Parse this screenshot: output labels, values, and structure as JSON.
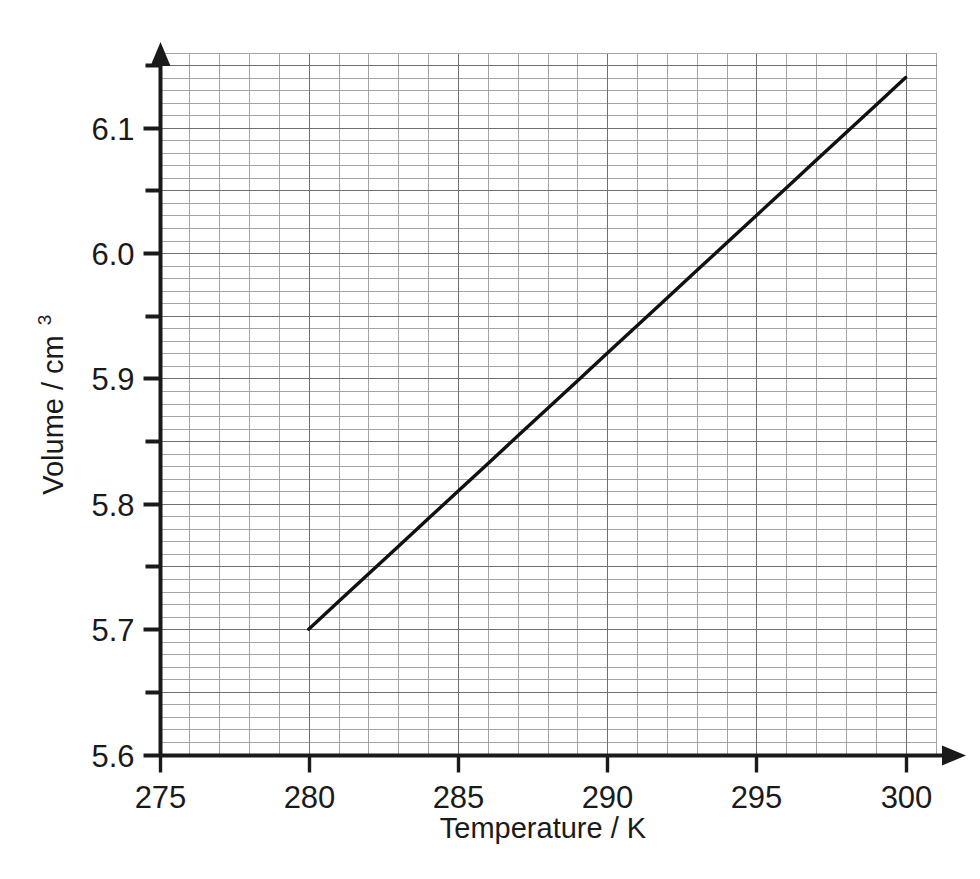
{
  "chart_data": {
    "type": "line",
    "title": "",
    "xlabel": "Temperature / K",
    "ylabel": "Volume / cm",
    "ylabel_superscript": "3",
    "ylabel_full": "Volume / cm3",
    "xlim": [
      275,
      301
    ],
    "ylim": [
      5.6,
      6.16
    ],
    "x_tick_labels": [
      "275",
      "280",
      "285",
      "290",
      "295",
      "300"
    ],
    "x_tick_values": [
      275,
      280,
      285,
      290,
      295,
      300
    ],
    "y_tick_labels": [
      "5.6",
      "5.7",
      "5.8",
      "5.9",
      "6.0",
      "6.1"
    ],
    "y_tick_values": [
      5.6,
      5.7,
      5.8,
      5.9,
      6.0,
      6.1
    ],
    "y_minor_tick_values": [
      5.65,
      5.75,
      5.85,
      5.95,
      6.05,
      6.15
    ],
    "grid": true,
    "grid_minor_step_x": 1,
    "grid_minor_step_y": 0.01,
    "grid_major_step_x": 5,
    "grid_major_step_y": 0.05,
    "legend": "none",
    "line_color": "#111111",
    "grid_color": "#8d8d8d",
    "axis_color": "#1a1a1a",
    "series": [
      {
        "name": "Volume vs Temperature",
        "x": [
          280,
          281,
          282,
          283,
          284,
          285,
          286,
          287,
          288,
          289,
          290,
          291,
          292,
          293,
          294,
          295,
          296,
          297,
          298,
          299,
          300
        ],
        "values": [
          5.7,
          5.722,
          5.744,
          5.766,
          5.788,
          5.81,
          5.832,
          5.854,
          5.876,
          5.898,
          5.92,
          5.942,
          5.964,
          5.986,
          6.008,
          6.03,
          6.052,
          6.074,
          6.096,
          6.118,
          6.14
        ],
        "start_point": [
          280,
          5.7
        ],
        "end_point": [
          300,
          6.14
        ],
        "slope": 0.022
      }
    ]
  }
}
